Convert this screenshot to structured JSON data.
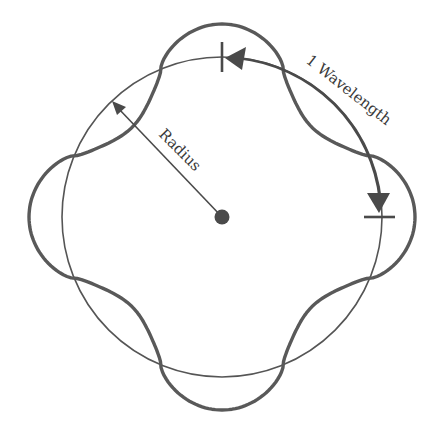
{
  "diagram": {
    "labels": {
      "radius": "Radius",
      "wavelength": "1 Wavelength"
    },
    "geometry": {
      "center": [
        222,
        217
      ],
      "circle_radius": 160,
      "wave_amplitude": 33,
      "wave_lobes": 4
    },
    "colors": {
      "stroke": "#4a4a4a",
      "wave": "#555555",
      "background": "#ffffff"
    }
  }
}
